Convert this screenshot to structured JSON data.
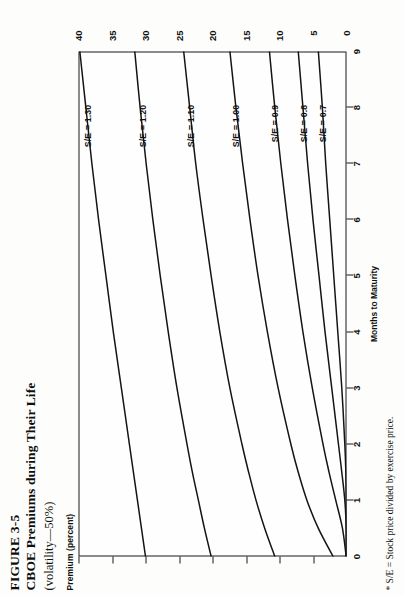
{
  "figure": {
    "number": "FIGURE 3-5",
    "title": "CBOE Premiums during Their Life",
    "subtitle": "(volatility—50%)",
    "footnote": "* S/E = Stock price divided by exercise price."
  },
  "axes": {
    "ylabel": "Premium (percent)",
    "xlabel": "Months to Maturity",
    "yticks": [
      "0",
      "5",
      "10",
      "15",
      "20",
      "25",
      "30",
      "35",
      "40"
    ],
    "xticks": [
      "0",
      "1",
      "2",
      "3",
      "4",
      "5",
      "6",
      "7",
      "8",
      "9"
    ],
    "origin_label": "0"
  },
  "chart_data": {
    "type": "line",
    "title": "CBOE Premiums during Their Life",
    "subtitle": "(volatility—50%)",
    "xlabel": "Months to Maturity",
    "ylabel": "Premium (percent)",
    "xlim": [
      0,
      9
    ],
    "ylim": [
      0,
      40
    ],
    "xticks": [
      0,
      1,
      2,
      3,
      4,
      5,
      6,
      7,
      8,
      9
    ],
    "yticks": [
      0,
      5,
      10,
      15,
      20,
      25,
      30,
      35,
      40
    ],
    "grid": false,
    "legend": "inline-curve-labels",
    "x": [
      0,
      0.5,
      1,
      1.5,
      2,
      3,
      4,
      5,
      6,
      7,
      8,
      9
    ],
    "series": [
      {
        "name": "S/E = 1.30",
        "label": "S/E = 1.30",
        "values": [
          30.0,
          30.6,
          31.2,
          31.8,
          32.4,
          33.6,
          34.8,
          35.9,
          37.0,
          38.0,
          38.9,
          39.8
        ],
        "label_x": 8.05,
        "label_y": 38.6
      },
      {
        "name": "S/E = 1.20",
        "label": "S/E = 1.20",
        "values": [
          20.2,
          21.2,
          22.1,
          23.0,
          23.8,
          25.3,
          26.6,
          27.8,
          28.9,
          29.9,
          30.8,
          31.6
        ],
        "label_x": 8.05,
        "label_y": 30.5
      },
      {
        "name": "S/E = 1.10",
        "label": "S/E = 1.10",
        "values": [
          10.7,
          12.2,
          13.5,
          14.6,
          15.6,
          17.4,
          18.9,
          20.2,
          21.4,
          22.5,
          23.4,
          24.3
        ],
        "label_x": 8.05,
        "label_y": 23.3
      },
      {
        "name": "S/E = 1.00",
        "label": "S/E = 1.00",
        "values": [
          2.0,
          4.2,
          5.9,
          7.2,
          8.3,
          10.2,
          11.8,
          13.2,
          14.4,
          15.5,
          16.5,
          17.4
        ],
        "label_x": 8.05,
        "label_y": 16.5
      },
      {
        "name": "S/E = 0.9",
        "label": "S/E = 0.9",
        "values": [
          0.05,
          0.6,
          1.6,
          2.6,
          3.5,
          5.1,
          6.5,
          7.7,
          8.8,
          9.8,
          10.7,
          11.5
        ],
        "label_x": 8.05,
        "label_y": 10.8
      },
      {
        "name": "S/E = 0.8",
        "label": "S/E = 0.8",
        "values": [
          0.0,
          0.03,
          0.25,
          0.7,
          1.2,
          2.2,
          3.2,
          4.1,
          5.0,
          5.8,
          6.5,
          7.2
        ],
        "label_x": 8.05,
        "label_y": 6.4
      },
      {
        "name": "S/E = 0.7",
        "label": "S/E = 0.7",
        "values": [
          0.0,
          0.0,
          0.02,
          0.1,
          0.25,
          0.7,
          1.3,
          1.9,
          2.5,
          3.1,
          3.6,
          4.2
        ],
        "label_x": 8.05,
        "label_y": 3.6
      }
    ]
  }
}
